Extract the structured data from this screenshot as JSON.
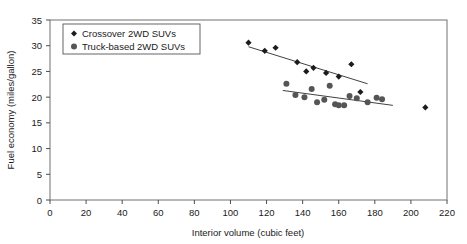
{
  "chart_data": {
    "type": "scatter",
    "title": "",
    "xlabel": "Interior volume (cubic feet)",
    "ylabel": "Fuel economy (miles/gallon)",
    "xlim": [
      0,
      220
    ],
    "ylim": [
      0,
      35
    ],
    "xticks": [
      0,
      20,
      40,
      60,
      80,
      100,
      120,
      140,
      160,
      180,
      200,
      220
    ],
    "yticks": [
      0,
      5,
      10,
      15,
      20,
      25,
      30,
      35
    ],
    "grid": false,
    "legend_position": "upper-left-inside",
    "series": [
      {
        "name": "Crossover 2WD SUVs",
        "marker": "diamond",
        "color": "#1c1c1c",
        "points": [
          [
            110,
            30.6
          ],
          [
            119,
            29.0
          ],
          [
            125,
            29.6
          ],
          [
            137,
            26.8
          ],
          [
            142,
            25.0
          ],
          [
            146,
            25.7
          ],
          [
            153,
            24.7
          ],
          [
            160,
            24.0
          ],
          [
            167,
            26.4
          ],
          [
            172,
            21.0
          ],
          [
            208,
            18.0
          ]
        ],
        "trend": {
          "x1": 110,
          "y1": 29.8,
          "x2": 176,
          "y2": 22.6
        }
      },
      {
        "name": "Truck-based 2WD SUVs",
        "marker": "circle",
        "color": "#555555",
        "points": [
          [
            131,
            22.6
          ],
          [
            136,
            20.4
          ],
          [
            141,
            20.0
          ],
          [
            145,
            21.6
          ],
          [
            148,
            19.0
          ],
          [
            152,
            19.5
          ],
          [
            155,
            22.2
          ],
          [
            158,
            18.6
          ],
          [
            160,
            18.4
          ],
          [
            163,
            18.4
          ],
          [
            166,
            20.2
          ],
          [
            170,
            19.8
          ],
          [
            176,
            19.0
          ],
          [
            181,
            19.9
          ],
          [
            184,
            19.6
          ]
        ],
        "trend": {
          "x1": 129,
          "y1": 21.3,
          "x2": 190,
          "y2": 18.4
        }
      }
    ]
  },
  "axes": {
    "x_title": "Interior volume (cubic feet)",
    "y_title": "Fuel economy (miles/gallon)",
    "x_tick_labels": [
      "0",
      "20",
      "40",
      "60",
      "80",
      "100",
      "120",
      "140",
      "160",
      "180",
      "200",
      "220"
    ],
    "y_tick_labels": [
      "0",
      "5",
      "10",
      "15",
      "20",
      "25",
      "30",
      "35"
    ]
  },
  "legend": {
    "entries": [
      {
        "label": "Crossover 2WD SUVs",
        "marker": "diamond-marker-icon"
      },
      {
        "label": "Truck-based 2WD SUVs",
        "marker": "circle-marker-icon"
      }
    ]
  },
  "colors": {
    "crossover": "#1c1c1c",
    "truck_based": "#555555",
    "axis": "#4d4d4d",
    "frame": "#707070",
    "background": "#ffffff"
  }
}
